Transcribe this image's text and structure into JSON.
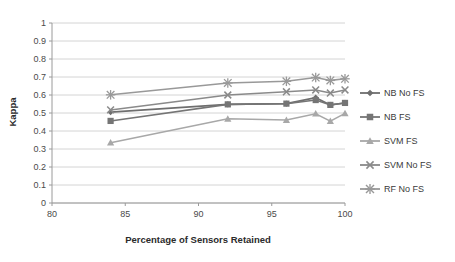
{
  "chart_data": {
    "type": "line",
    "title": "",
    "xlabel": "Percentage of Sensors Retained",
    "ylabel": "Kappa",
    "xlim": [
      80,
      100
    ],
    "ylim": [
      0,
      1
    ],
    "xticks": [
      80,
      85,
      90,
      95,
      100
    ],
    "yticks": [
      0,
      0.1,
      0.2,
      0.3,
      0.4,
      0.5,
      0.6,
      0.7,
      0.8,
      0.9,
      1
    ],
    "xtick_labels": [
      "80",
      "85",
      "90",
      "95",
      "100"
    ],
    "ytick_labels": [
      "0",
      "0.1",
      "0.2",
      "0.3",
      "0.4",
      "0.5",
      "0.6",
      "0.7",
      "0.8",
      "0.9",
      "1"
    ],
    "grid": "horizontal",
    "legend_position": "right",
    "x": [
      84,
      92,
      96,
      98,
      99,
      100
    ],
    "series": [
      {
        "name": "NB No FS",
        "marker": "diamond",
        "color": "#6e6e6e",
        "values": [
          0.505,
          0.548,
          0.552,
          0.585,
          0.545,
          0.556
        ]
      },
      {
        "name": "NB FS",
        "marker": "square",
        "color": "#757575",
        "values": [
          0.456,
          0.548,
          0.552,
          0.572,
          0.545,
          0.556
        ]
      },
      {
        "name": "SVM FS",
        "marker": "triangle",
        "color": "#a8a8a8",
        "values": [
          0.335,
          0.468,
          0.461,
          0.496,
          0.455,
          0.498
        ]
      },
      {
        "name": "SVM No FS",
        "marker": "cross",
        "color": "#8a8a8a",
        "values": [
          0.517,
          0.6,
          0.618,
          0.628,
          0.611,
          0.628
        ]
      },
      {
        "name": "RF No FS",
        "marker": "asterisk",
        "color": "#999999",
        "values": [
          0.601,
          0.667,
          0.676,
          0.697,
          0.681,
          0.69
        ]
      }
    ]
  },
  "legend": {
    "items": [
      {
        "label": "NB No FS"
      },
      {
        "label": "NB FS"
      },
      {
        "label": "SVM FS"
      },
      {
        "label": "SVM No FS"
      },
      {
        "label": "RF No FS"
      }
    ]
  },
  "colors": {
    "axis": "#9a9a9a",
    "grid": "#d4d4d4",
    "text": "#3a3a3a",
    "background": "#ffffff"
  }
}
